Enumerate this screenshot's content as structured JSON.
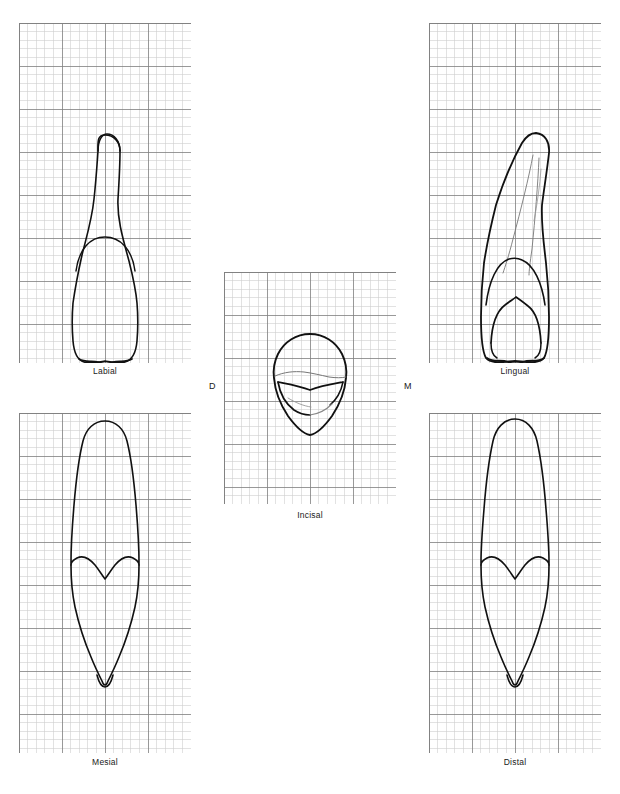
{
  "figure": {
    "type": "dental-anatomy-plate",
    "background_color": "#ffffff",
    "outline_color": "#111111",
    "detail_color": "#555555",
    "grid": {
      "minor_color": "#cfcfcf",
      "major_color": "#808080",
      "minor_step_px": 8.6,
      "major_every": 5
    }
  },
  "panels": [
    {
      "id": "labial",
      "label": "Labial",
      "x": 19,
      "y": 23,
      "width": 172,
      "height": 340,
      "label_y": 366,
      "cols": 20,
      "rows": 40
    },
    {
      "id": "lingual",
      "label": "Lingual",
      "x": 429,
      "y": 23,
      "width": 172,
      "height": 340,
      "label_y": 366,
      "cols": 20,
      "rows": 40
    },
    {
      "id": "incisal",
      "label": "Incisal",
      "x": 224,
      "y": 272,
      "width": 172,
      "height": 232,
      "label_y": 510,
      "cols": 20,
      "rows": 27
    },
    {
      "id": "mesial",
      "label": "Mesial",
      "x": 19,
      "y": 413,
      "width": 172,
      "height": 340,
      "label_y": 757,
      "cols": 20,
      "rows": 40
    },
    {
      "id": "distal",
      "label": "Distal",
      "x": 429,
      "y": 413,
      "width": 172,
      "height": 340,
      "label_y": 757,
      "cols": 20,
      "rows": 40
    }
  ],
  "orientation_labels": [
    {
      "id": "distal-marker",
      "text": "D",
      "x": 209,
      "y": 381
    },
    {
      "id": "mesial-marker",
      "text": "M",
      "x": 404,
      "y": 381
    }
  ]
}
